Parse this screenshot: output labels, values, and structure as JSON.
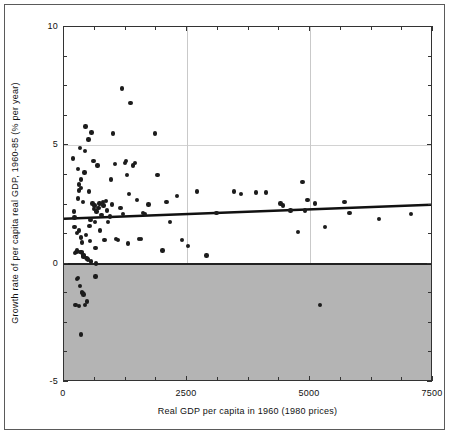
{
  "chart_data": {
    "type": "scatter",
    "title": "",
    "xlabel": "Real GDP per capita in 1960 (1980 prices)",
    "ylabel": "Growth rate of per capita real GDP, 1960-85 (% per year)",
    "xlim": [
      0,
      7500
    ],
    "ylim": [
      -5,
      10
    ],
    "xticks": [
      0,
      2500,
      5000,
      7500
    ],
    "xtick_labels": [
      "0",
      "2500",
      "5000",
      "7500"
    ],
    "yticks": [
      -5,
      0,
      5,
      10
    ],
    "ytick_labels": [
      "-5",
      "0",
      "5",
      "10"
    ],
    "grid": "vertical gridlines at 2500 and 5000; light horizontal gridline at 5",
    "legend": "none",
    "shaded_region": {
      "description": "grey shading of the negative growth region",
      "y_from": -5,
      "y_to": 0,
      "color": "#b4b4b4"
    },
    "zero_line": {
      "y": 0,
      "color": "#222222"
    },
    "trend_line": {
      "description": "fitted regression line of growth on initial GDP per capita",
      "x0": 0,
      "y0": 1.85,
      "x1": 7500,
      "y1": 2.45,
      "color": "#111111"
    },
    "point_color": "#1c1c1c",
    "points": [
      [
        180,
        4.45
      ],
      [
        200,
        2.2
      ],
      [
        210,
        1.95
      ],
      [
        215,
        1.55
      ],
      [
        225,
        0.45
      ],
      [
        250,
        0.5
      ],
      [
        260,
        0.55
      ],
      [
        270,
        1.3
      ],
      [
        280,
        4.0
      ],
      [
        290,
        2.75
      ],
      [
        300,
        3.35
      ],
      [
        305,
        3.1
      ],
      [
        310,
        1.4
      ],
      [
        320,
        0.5
      ],
      [
        330,
        4.9
      ],
      [
        340,
        3.55
      ],
      [
        345,
        3.2
      ],
      [
        350,
        1.1
      ],
      [
        355,
        0.5
      ],
      [
        360,
        0.45
      ],
      [
        370,
        0.9
      ],
      [
        380,
        2.6
      ],
      [
        390,
        0.35
      ],
      [
        400,
        0.3
      ],
      [
        410,
        0.35
      ],
      [
        420,
        3.85
      ],
      [
        430,
        4.75
      ],
      [
        440,
        5.8
      ],
      [
        450,
        1.2
      ],
      [
        460,
        0.25
      ],
      [
        470,
        0.2
      ],
      [
        480,
        0.2
      ],
      [
        490,
        0.15
      ],
      [
        500,
        5.25
      ],
      [
        510,
        3.05
      ],
      [
        520,
        1.6
      ],
      [
        530,
        0.95
      ],
      [
        540,
        1.85
      ],
      [
        545,
        0.1
      ],
      [
        560,
        5.55
      ],
      [
        580,
        2.55
      ],
      [
        600,
        4.35
      ],
      [
        610,
        2.3
      ],
      [
        620,
        2.45
      ],
      [
        630,
        1.75
      ],
      [
        640,
        0.65
      ],
      [
        650,
        0.0
      ],
      [
        660,
        2.2
      ],
      [
        680,
        4.15
      ],
      [
        700,
        2.35
      ],
      [
        720,
        2.55
      ],
      [
        730,
        1.4
      ],
      [
        760,
        2.05
      ],
      [
        790,
        2.6
      ],
      [
        800,
        2.45
      ],
      [
        820,
        1.0
      ],
      [
        850,
        2.65
      ],
      [
        880,
        2.25
      ],
      [
        900,
        1.75
      ],
      [
        930,
        2.0
      ],
      [
        960,
        3.55
      ],
      [
        980,
        2.5
      ],
      [
        1000,
        5.5
      ],
      [
        1040,
        4.2
      ],
      [
        1060,
        1.05
      ],
      [
        1100,
        1.0
      ],
      [
        1150,
        2.35
      ],
      [
        1180,
        7.4
      ],
      [
        1200,
        2.1
      ],
      [
        1240,
        4.25
      ],
      [
        1260,
        4.35
      ],
      [
        1280,
        3.75
      ],
      [
        1300,
        0.85
      ],
      [
        1320,
        2.95
      ],
      [
        1350,
        6.8
      ],
      [
        1400,
        4.15
      ],
      [
        1440,
        4.25
      ],
      [
        1480,
        2.7
      ],
      [
        1520,
        1.05
      ],
      [
        1560,
        1.05
      ],
      [
        1600,
        2.15
      ],
      [
        1650,
        2.1
      ],
      [
        1720,
        2.5
      ],
      [
        1850,
        5.5
      ],
      [
        1900,
        3.75
      ],
      [
        2000,
        0.55
      ],
      [
        2080,
        2.6
      ],
      [
        2150,
        1.75
      ],
      [
        2300,
        2.85
      ],
      [
        2400,
        1.0
      ],
      [
        2520,
        0.75
      ],
      [
        2700,
        3.05
      ],
      [
        2900,
        0.35
      ],
      [
        3100,
        2.15
      ],
      [
        3450,
        3.05
      ],
      [
        3600,
        2.95
      ],
      [
        3900,
        3.0
      ],
      [
        4100,
        3.0
      ],
      [
        4400,
        2.55
      ],
      [
        4450,
        2.45
      ],
      [
        4600,
        2.25
      ],
      [
        4750,
        1.35
      ],
      [
        4850,
        3.45
      ],
      [
        4900,
        2.25
      ],
      [
        4950,
        2.7
      ],
      [
        5100,
        2.55
      ],
      [
        5200,
        -1.75
      ],
      [
        5300,
        1.55
      ],
      [
        5700,
        2.6
      ],
      [
        5800,
        2.15
      ],
      [
        6400,
        1.9
      ],
      [
        7050,
        2.1
      ],
      [
        230,
        -1.75
      ],
      [
        260,
        -0.65
      ],
      [
        290,
        -0.6
      ],
      [
        300,
        -1.8
      ],
      [
        330,
        -0.95
      ],
      [
        345,
        -3.0
      ],
      [
        360,
        -1.2
      ],
      [
        375,
        -1.25
      ],
      [
        400,
        -1.3
      ],
      [
        430,
        -1.75
      ],
      [
        470,
        -1.6
      ],
      [
        640,
        -0.55
      ]
    ]
  }
}
